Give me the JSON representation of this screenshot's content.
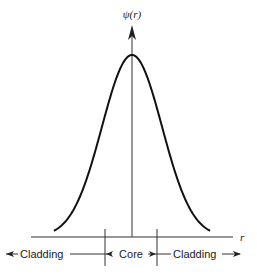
{
  "diagram": {
    "y_axis_label": "ψ(r)",
    "x_axis_label": "r",
    "regions": [
      {
        "name": "cladding-left",
        "label": "Cladding",
        "direction": "left"
      },
      {
        "name": "core",
        "label": "Core",
        "direction": "both"
      },
      {
        "name": "cladding-right",
        "label": "Cladding",
        "direction": "right"
      }
    ],
    "curve": {
      "type": "gaussian",
      "peak_at": "center",
      "description": "field amplitude vs radius"
    },
    "colors": {
      "stroke": "#111111",
      "axis": "#333333",
      "background": "#ffffff"
    }
  }
}
